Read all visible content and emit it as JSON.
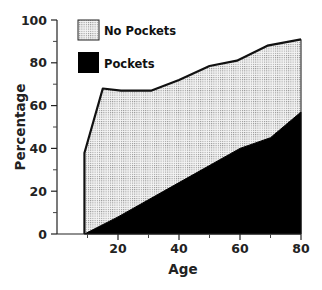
{
  "chart_data": {
    "type": "area",
    "title": "",
    "xlabel": "Age",
    "ylabel": "Percentage",
    "xlim": [
      0,
      80
    ],
    "ylim": [
      0,
      100
    ],
    "xticks": [
      20,
      40,
      60,
      80
    ],
    "xticks_minor": [
      10,
      30,
      50,
      70
    ],
    "yticks": [
      0,
      20,
      40,
      60,
      80,
      100
    ],
    "yticks_minor": [
      10,
      30,
      50,
      70,
      90
    ],
    "grid": false,
    "legend_position": "upper-left",
    "stacked": false,
    "series": [
      {
        "name": "No Pockets",
        "fill": "dotted-gray",
        "x": [
          9,
          15,
          21,
          31,
          40,
          50,
          59,
          69,
          80
        ],
        "y": [
          38,
          68,
          67,
          67,
          72,
          78.5,
          81,
          88,
          91
        ]
      },
      {
        "name": "Pockets",
        "fill": "#000000",
        "x": [
          9,
          20,
          40,
          60,
          70,
          80
        ],
        "y": [
          0,
          8,
          24,
          40,
          45,
          57
        ]
      }
    ]
  },
  "legend": {
    "items": [
      {
        "label": "No Pockets"
      },
      {
        "label": "Pockets"
      }
    ]
  },
  "axes": {
    "x_title": "Age",
    "y_title": "Percentage",
    "x_tick_labels": [
      "20",
      "40",
      "60",
      "80"
    ],
    "y_tick_labels": [
      "0",
      "20",
      "40",
      "60",
      "80",
      "100"
    ]
  },
  "colors": {
    "pockets": "#000000",
    "no_pockets_bg": "#f2f2f2",
    "no_pockets_dot": "#7a7a7a",
    "line": "#111111"
  }
}
